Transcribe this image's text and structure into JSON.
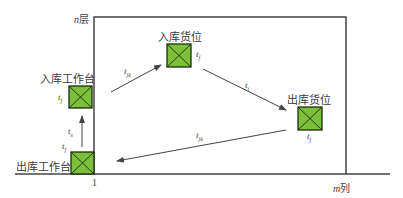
{
  "diagram": {
    "title": "",
    "colors": {
      "slot_fill": "#7bbf3a",
      "slot_border": "#1e2a10",
      "line": "#444444"
    },
    "axes": {
      "y_top_label": {
        "var": "n",
        "unit": "层"
      },
      "x_right_label": {
        "var": "m",
        "unit": "列"
      },
      "x_origin_label": "1"
    },
    "nodes": [
      {
        "id": "outbound-station",
        "label": "出库工作台",
        "time_label": "t",
        "time_sub": "f"
      },
      {
        "id": "inbound-station",
        "label": "入库工作台",
        "time_label": "t",
        "time_sub": "f"
      },
      {
        "id": "inbound-slot",
        "label": "入库货位",
        "time_label": "t",
        "time_sub": "f"
      },
      {
        "id": "outbound-slot",
        "label": "出库货位",
        "time_label": "t",
        "time_sub": "f"
      }
    ],
    "edges": [
      {
        "from": "outbound-station",
        "to": "inbound-station",
        "time_label": "t",
        "time_sub": "s"
      },
      {
        "from": "inbound-station",
        "to": "inbound-slot",
        "time_label": "t",
        "time_sub": "jk"
      },
      {
        "from": "inbound-slot",
        "to": "outbound-slot",
        "time_label": "t",
        "time_sub": "t"
      },
      {
        "from": "outbound-slot",
        "to": "outbound-station",
        "time_label": "t",
        "time_sub": "jk"
      }
    ]
  }
}
